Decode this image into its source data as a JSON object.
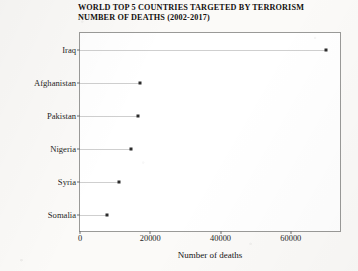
{
  "chart_data": {
    "type": "scatter",
    "title": "WORLD TOP 5 COUNTRIES TARGETED BY TERRORISM\nNUMBER OF DEATHS (2002-2017)",
    "title_line1": "WORLD TOP 5 COUNTRIES TARGETED BY TERRORISM",
    "title_line2": "NUMBER OF DEATHS (2002-2017)",
    "xlabel": "Number of deaths",
    "ylabel": "",
    "orientation": "horizontal",
    "categories": [
      "Iraq",
      "Afghanistan",
      "Pakistan",
      "Nigeria",
      "Syria",
      "Somalia"
    ],
    "values": [
      70000,
      17000,
      16500,
      14500,
      11200,
      7600
    ],
    "xlim": [
      0,
      74000
    ],
    "xticks": [
      0,
      20000,
      40000,
      60000
    ],
    "xtick_labels": [
      "0",
      "20000",
      "40000",
      "60000"
    ],
    "grid": false,
    "legend": "none",
    "marker": "square",
    "marker_color": "#2b2b2b",
    "stem_color": "#cfcfcf",
    "frame_color": "#9a9a98",
    "plot_background": "#ffffff",
    "page_background": "#fbfaf8"
  }
}
